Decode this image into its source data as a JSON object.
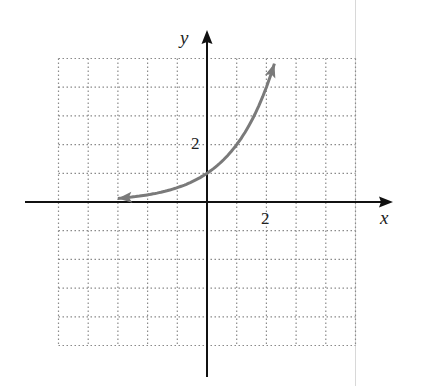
{
  "chart_data": {
    "type": "line",
    "title": "",
    "xlabel": "x",
    "ylabel": "y",
    "xlim": [
      -5,
      5
    ],
    "ylim": [
      -5,
      5
    ],
    "grid": true,
    "grid_style": "dotted",
    "x_tick_labels": [
      {
        "value": 2,
        "label": "2"
      }
    ],
    "y_tick_labels": [
      {
        "value": 2,
        "label": "2"
      }
    ],
    "series": [
      {
        "name": "y = 2^x",
        "color": "#7a7a7a",
        "arrows": "both",
        "x": [
          -3.0,
          -2.5,
          -2.0,
          -1.5,
          -1.0,
          -0.5,
          0.0,
          0.5,
          1.0,
          1.5,
          2.0,
          2.27
        ],
        "y": [
          0.125,
          0.177,
          0.25,
          0.354,
          0.5,
          0.707,
          1.0,
          1.414,
          2.0,
          2.828,
          4.0,
          4.82
        ]
      }
    ],
    "key_points": [
      {
        "x": 0,
        "y": 1
      },
      {
        "x": 1,
        "y": 2
      }
    ]
  },
  "labels": {
    "x_axis": "x",
    "y_axis": "y",
    "x_tick": "2",
    "y_tick": "2"
  },
  "colors": {
    "axis": "#111111",
    "grid": "#8a8a8a",
    "curve": "#7a7a7a"
  }
}
